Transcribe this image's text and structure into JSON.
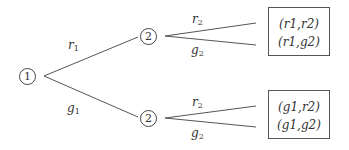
{
  "tree": {
    "root": {
      "label": "1"
    },
    "stage2_nodes": [
      {
        "label": "2"
      },
      {
        "label": "2"
      }
    ],
    "first_branches": [
      {
        "var": "r",
        "sub": "1"
      },
      {
        "var": "g",
        "sub": "1"
      }
    ],
    "second_branches": [
      {
        "var": "r",
        "sub": "2"
      },
      {
        "var": "g",
        "sub": "2"
      }
    ],
    "outcome_boxes": [
      {
        "lines": [
          "(r1,r2)",
          "(r1,g2)"
        ]
      },
      {
        "lines": [
          "(g1,r2)",
          "(g1,g2)"
        ]
      }
    ]
  }
}
